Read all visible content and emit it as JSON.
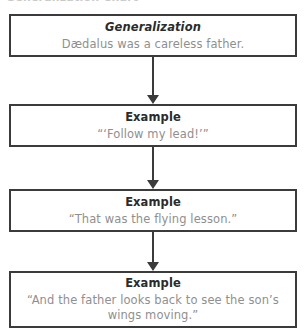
{
  "page": {
    "clipped_title": "Generalization Chart"
  },
  "flowchart": {
    "boxes": [
      {
        "heading": "Generalization",
        "heading_style": "bold-italic",
        "body": "Dædalus was a careless father."
      },
      {
        "heading": "Example",
        "heading_style": "bold",
        "body": "“‘Follow my lead!’”"
      },
      {
        "heading": "Example",
        "heading_style": "bold",
        "body": "“That was the flying lesson.”"
      },
      {
        "heading": "Example",
        "heading_style": "bold",
        "body": "“And the father looks back to see the son’s\nwings moving.”"
      }
    ],
    "connector_count": 3,
    "colors": {
      "border": "#3b3b3b",
      "heading_text": "#2b2b2b",
      "body_text": "#8f8f8f",
      "background": "#ffffff"
    }
  }
}
